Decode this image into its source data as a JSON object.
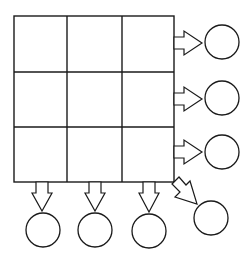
{
  "diagram": {
    "grid": {
      "rows": 3,
      "cols": 3,
      "x": 14,
      "y": 16,
      "width": 160,
      "height": 166,
      "cells": [
        [
          "",
          "",
          ""
        ],
        [
          "",
          "",
          ""
        ],
        [
          "",
          "",
          ""
        ]
      ]
    },
    "outputs": {
      "rows": [
        {
          "label": "row-1",
          "circle": {
            "cx": 222,
            "cy": 42,
            "r": 17
          }
        },
        {
          "label": "row-2",
          "circle": {
            "cx": 222,
            "cy": 98,
            "r": 17
          }
        },
        {
          "label": "row-3",
          "circle": {
            "cx": 222,
            "cy": 152,
            "r": 17
          }
        }
      ],
      "columns": [
        {
          "label": "column-1",
          "circle": {
            "cx": 43,
            "cy": 231,
            "r": 17
          }
        },
        {
          "label": "column-2",
          "circle": {
            "cx": 95,
            "cy": 231,
            "r": 17
          }
        },
        {
          "label": "column-3",
          "circle": {
            "cx": 149,
            "cy": 232,
            "r": 17
          }
        }
      ],
      "diagonal": {
        "label": "diagonal",
        "circle": {
          "cx": 211,
          "cy": 218,
          "r": 17
        }
      }
    },
    "colors": {
      "stroke": "#1a1a1a",
      "background": "#ffffff"
    }
  }
}
